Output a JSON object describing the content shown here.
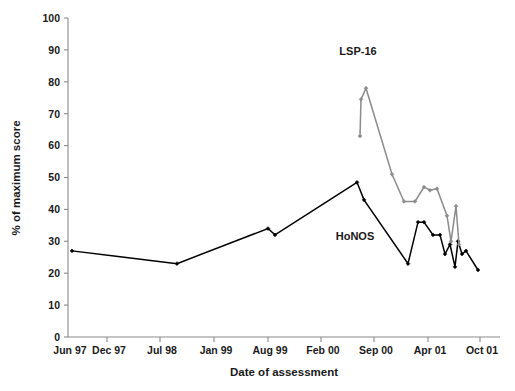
{
  "chart_data": {
    "type": "line",
    "title": "",
    "xlabel": "Date of assessment",
    "ylabel": "% of maximum score",
    "ylim": [
      0,
      100
    ],
    "ytick_step": 10,
    "yticks": [
      "0",
      "10",
      "20",
      "30",
      "40",
      "50",
      "60",
      "70",
      "80",
      "90",
      "100"
    ],
    "xticks": [
      "Jun 97",
      "Dec 97",
      "Jul 98",
      "Jan 99",
      "Aug 99",
      "Feb 00",
      "Sep 00",
      "Apr 01",
      "Oct 01"
    ],
    "grid": false,
    "legend_position": "inline-annotation",
    "annotations": [
      {
        "text": "LSP-16",
        "x_px": 358,
        "y_px": 55
      },
      {
        "text": "HoNOS",
        "x_px": 355,
        "y_px": 240
      }
    ],
    "series": [
      {
        "name": "HoNOS",
        "color": "#000000",
        "marker": "diamond",
        "points": [
          {
            "x_px": 72,
            "value": 27
          },
          {
            "x_px": 177,
            "value": 23
          },
          {
            "x_px": 268,
            "value": 34
          },
          {
            "x_px": 275,
            "value": 32
          },
          {
            "x_px": 357,
            "value": 48.5
          },
          {
            "x_px": 364,
            "value": 43
          },
          {
            "x_px": 408,
            "value": 23
          },
          {
            "x_px": 418,
            "value": 36
          },
          {
            "x_px": 424,
            "value": 36
          },
          {
            "x_px": 433,
            "value": 32
          },
          {
            "x_px": 440,
            "value": 32
          },
          {
            "x_px": 445,
            "value": 26
          },
          {
            "x_px": 450,
            "value": 29
          },
          {
            "x_px": 455,
            "value": 22
          },
          {
            "x_px": 458,
            "value": 30
          },
          {
            "x_px": 462,
            "value": 26
          },
          {
            "x_px": 466,
            "value": 27
          },
          {
            "x_px": 478,
            "value": 21
          }
        ]
      },
      {
        "name": "LSP-16",
        "color": "#8c8c8c",
        "marker": "diamond",
        "points": [
          {
            "x_px": 360,
            "value": 63
          },
          {
            "x_px": 361,
            "value": 74.5
          },
          {
            "x_px": 366,
            "value": 78
          },
          {
            "x_px": 392,
            "value": 51
          },
          {
            "x_px": 404,
            "value": 42.5
          },
          {
            "x_px": 415,
            "value": 42.5
          },
          {
            "x_px": 424,
            "value": 47
          },
          {
            "x_px": 430,
            "value": 46
          },
          {
            "x_px": 437,
            "value": 46.5
          },
          {
            "x_px": 447,
            "value": 38
          },
          {
            "x_px": 451,
            "value": 30
          },
          {
            "x_px": 456,
            "value": 41
          },
          {
            "x_px": 459,
            "value": 29
          }
        ]
      }
    ]
  },
  "geometry": {
    "plot_left_px": 68,
    "plot_right_px": 500,
    "plot_top_px": 18,
    "plot_bottom_px": 337,
    "xtick_px": [
      68,
      107,
      160,
      214,
      268,
      321,
      374,
      428,
      480
    ]
  }
}
